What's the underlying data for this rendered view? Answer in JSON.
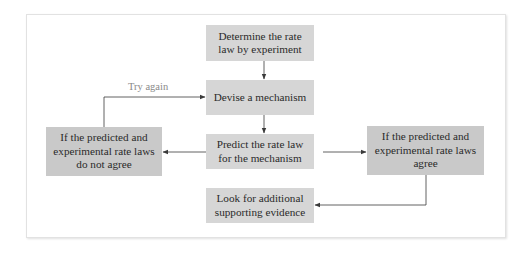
{
  "diagram": {
    "type": "flowchart",
    "colors": {
      "center_box_fill": "#d6d6d6",
      "side_box_fill": "#c9c9c9",
      "text": "#2a2a2a",
      "connector": "#3a3a3a",
      "label": "#8a8a8a"
    },
    "nodes": [
      {
        "id": "determine",
        "label": "Determine the rate law by experiment"
      },
      {
        "id": "devise",
        "label": "Devise a mechanism"
      },
      {
        "id": "predict",
        "label": "Predict the rate law for the mechanism"
      },
      {
        "id": "not_agree",
        "label": "If the predicted and experimental rate laws do not agree"
      },
      {
        "id": "agree",
        "label": "If the predicted and experimental rate laws agree"
      },
      {
        "id": "look",
        "label": "Look for additional supporting evidence"
      }
    ],
    "edges": [
      {
        "from": "determine",
        "to": "devise",
        "label": ""
      },
      {
        "from": "devise",
        "to": "predict",
        "label": ""
      },
      {
        "from": "predict",
        "to": "not_agree",
        "label": ""
      },
      {
        "from": "predict",
        "to": "agree",
        "label": ""
      },
      {
        "from": "not_agree",
        "to": "devise",
        "label": "Try again"
      },
      {
        "from": "agree",
        "to": "look",
        "label": ""
      }
    ],
    "edge_labels": {
      "try_again": "Try again"
    }
  }
}
